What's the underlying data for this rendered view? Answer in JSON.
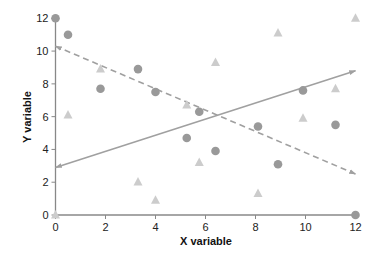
{
  "chart_data": {
    "type": "scatter",
    "title": "",
    "xlabel": "X variable",
    "ylabel": "Y variable",
    "xlim": [
      0,
      12
    ],
    "ylim": [
      0,
      12
    ],
    "xticks": [
      0,
      2,
      4,
      6,
      8,
      10,
      12
    ],
    "yticks": [
      0,
      2,
      4,
      6,
      8,
      10,
      12
    ],
    "grid": false,
    "legend": null,
    "series": [
      {
        "name": "circles",
        "marker": "circle",
        "color": "#999999",
        "points": [
          [
            0,
            12
          ],
          [
            0.5,
            11
          ],
          [
            1.8,
            7.7
          ],
          [
            3.3,
            8.9
          ],
          [
            4,
            7.5
          ],
          [
            5.25,
            4.7
          ],
          [
            5.75,
            6.3
          ],
          [
            6.4,
            3.9
          ],
          [
            8.1,
            5.4
          ],
          [
            8.9,
            3.1
          ],
          [
            9.9,
            7.6
          ],
          [
            11.2,
            5.5
          ],
          [
            12,
            0
          ]
        ]
      },
      {
        "name": "triangles",
        "marker": "triangle",
        "color": "#cccccc",
        "points": [
          [
            0,
            0
          ],
          [
            0.5,
            6.1
          ],
          [
            1.8,
            8.9
          ],
          [
            3.3,
            2.0
          ],
          [
            4,
            0.9
          ],
          [
            5.25,
            6.7
          ],
          [
            5.75,
            3.2
          ],
          [
            6.4,
            9.3
          ],
          [
            8.1,
            1.3
          ],
          [
            8.9,
            11.1
          ],
          [
            9.9,
            5.9
          ],
          [
            11.2,
            7.7
          ],
          [
            12,
            12
          ]
        ]
      }
    ],
    "lines": [
      {
        "name": "solid-trend",
        "style": "solid",
        "color": "#a0a0a0",
        "arrows": "both",
        "from": [
          0,
          2.9
        ],
        "to": [
          12,
          8.8
        ]
      },
      {
        "name": "dashed-trend",
        "style": "dashed",
        "color": "#a0a0a0",
        "arrows": "both",
        "from": [
          0,
          10.3
        ],
        "to": [
          12,
          2.5
        ]
      }
    ]
  },
  "axis_color": "#888888"
}
